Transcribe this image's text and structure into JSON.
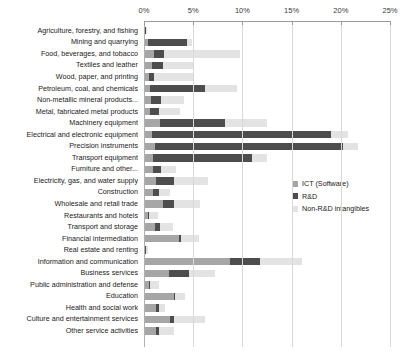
{
  "chart_data": {
    "type": "bar",
    "orientation": "horizontal",
    "stacked": true,
    "title": "",
    "subtitle": "",
    "xlabel": "",
    "ylabel": "",
    "xlim": [
      0,
      25
    ],
    "xticks": [
      0,
      5,
      10,
      15,
      20,
      25
    ],
    "xtick_labels": [
      "0%",
      "5%",
      "10%",
      "15%",
      "20%",
      "25%"
    ],
    "grid": true,
    "legend_position": "right",
    "categories": [
      "Agriculture, forestry, and fishing",
      "Mining and quarrying",
      "Food, beverages, and tobacco",
      "Textiles and leather",
      "Wood, paper, and printing",
      "Petroleum, coal, and chemicals",
      "Non-metallic mineral products...",
      "Metal, fabricated metal products",
      "Machinery equipment",
      "Electrical and electronic equipment",
      "Precision instruments",
      "Transport equipment",
      "Furniture and other...",
      "Electricity, gas, and water supply",
      "Construction",
      "Wholesale and retail trade",
      "Restaurants and hotels",
      "Transport and storage",
      "Financial intermediation",
      "Real estate and renting",
      "Information and communication",
      "Business services",
      "Public administration and defense",
      "Education",
      "Health and social work",
      "Culture and entertainment services",
      "Other service activities"
    ],
    "series": [
      {
        "name": "ICT (Software)",
        "color": "#a6a6a6",
        "values": [
          0.15,
          0.4,
          1.0,
          0.8,
          0.5,
          0.6,
          0.7,
          0.6,
          1.6,
          0.8,
          1.1,
          0.9,
          0.9,
          1.2,
          0.9,
          1.9,
          0.4,
          1.1,
          3.6,
          0.15,
          8.7,
          2.5,
          0.5,
          3.0,
          1.2,
          2.6,
          1.2
        ],
        "values_unit": "%"
      },
      {
        "name": "R&D",
        "color": "#4d4d4d",
        "values": [
          0.1,
          4.0,
          1.0,
          1.1,
          0.5,
          5.6,
          1.0,
          0.9,
          6.6,
          18.2,
          19.1,
          10.1,
          0.8,
          1.8,
          0.6,
          1.1,
          0.1,
          0.5,
          0.2,
          0.05,
          3.1,
          2.1,
          0.1,
          0.2,
          0.3,
          0.4,
          0.3
        ],
        "values_unit": "%"
      },
      {
        "name": "Non-R&D intangibles",
        "color": "#e3e3e3",
        "values": [
          0.05,
          0.5,
          7.8,
          3.1,
          4.0,
          3.3,
          2.4,
          2.2,
          4.3,
          1.7,
          1.5,
          1.5,
          1.6,
          3.5,
          1.1,
          2.7,
          0.9,
          1.3,
          1.8,
          0.2,
          4.3,
          2.6,
          0.9,
          1.0,
          0.6,
          3.2,
          1.6
        ],
        "values_unit": "%"
      }
    ]
  },
  "legend": {
    "items": [
      {
        "label": "ICT (Software)",
        "key": "ict"
      },
      {
        "label": "R&D",
        "key": "rnd"
      },
      {
        "label": "Non-R&D intangibles",
        "key": "nonrnd"
      }
    ]
  },
  "colors": {
    "ict": "#a6a6a6",
    "rnd": "#4d4d4d",
    "nonrnd": "#e3e3e3",
    "grid": "#d8d8d8",
    "axis": "#9a9a9a",
    "text": "#1a1a1a",
    "background": "#ffffff"
  }
}
